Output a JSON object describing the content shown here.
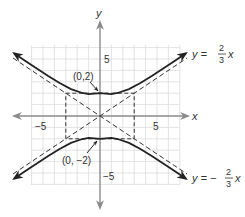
{
  "diagram": {
    "type": "hyperbola-graph",
    "equation": "y^2/4 - x^2/9 = 1",
    "axes": {
      "x_label": "x",
      "y_label": "y",
      "x_ticks": [
        {
          "value": -5,
          "label": "−5"
        },
        {
          "value": 5,
          "label": "5"
        }
      ],
      "y_ticks": [
        {
          "value": 5,
          "label": "5"
        },
        {
          "value": -5,
          "label": "−5"
        }
      ]
    },
    "vertices": [
      {
        "label": "(0,2)",
        "x": 0,
        "y": 2
      },
      {
        "label": "(0, −2)",
        "x": 0,
        "y": -2
      }
    ],
    "asymptotes": [
      {
        "label_prefix": "y = ",
        "numerator": "2",
        "denominator": "3",
        "var": "x",
        "slope": 0.6667
      },
      {
        "label_prefix": "y = −",
        "numerator": "2",
        "denominator": "3",
        "var": "x",
        "slope": -0.6667
      }
    ],
    "fundamental_rectangle": {
      "x_min": -3,
      "x_max": 3,
      "y_min": -2,
      "y_max": 2
    },
    "grid_range": {
      "x_min": -6,
      "x_max": 7,
      "y_min": -6,
      "y_max": 6
    },
    "colors": {
      "grid": "#d9d9d9",
      "axis": "#888888",
      "curve": "#222222",
      "dashed": "#333333",
      "text": "#333333"
    }
  }
}
